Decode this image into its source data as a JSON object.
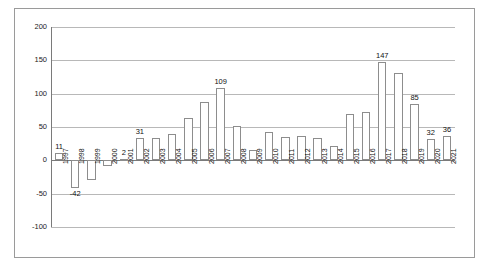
{
  "chart_data": {
    "type": "bar",
    "title": "",
    "subtitle": "",
    "xlabel": "",
    "ylabel": "",
    "ylim": [
      -100,
      200
    ],
    "yticks": [
      -100,
      -50,
      0,
      50,
      100,
      150,
      200
    ],
    "grid": true,
    "legend": null,
    "categories": [
      "1997",
      "1998",
      "1999",
      "2000",
      "2001",
      "2002",
      "2003",
      "2004",
      "2005",
      "2006",
      "2007",
      "2008",
      "2009",
      "2010",
      "2011",
      "2012",
      "2013",
      "2014",
      "2015",
      "2016",
      "2017",
      "2018",
      "2019",
      "2020",
      "2021"
    ],
    "values": [
      11,
      -42,
      -30,
      -8,
      2,
      34,
      33,
      40,
      64,
      88,
      109,
      51,
      15,
      42,
      35,
      36,
      33,
      22,
      70,
      72,
      147,
      131,
      85,
      32,
      36
    ],
    "point_labels": {
      "1997": "11",
      "1998": "-42",
      "2001": "2",
      "2002": "31",
      "2007": "109",
      "2017": "147",
      "2019": "85",
      "2020": "32",
      "2021": "36"
    }
  }
}
